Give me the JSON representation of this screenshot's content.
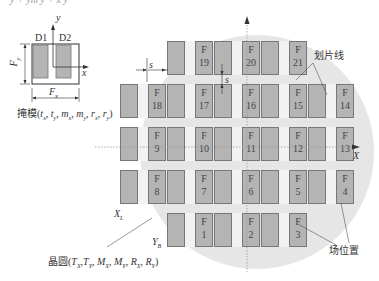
{
  "top_formula_fragment": "y + ym y + x y",
  "mask": {
    "die_labels": [
      "D1",
      "D2"
    ],
    "axis_x": "x",
    "axis_y": "y",
    "dim_height": "F_y",
    "dim_width": "F_x",
    "caption": "掩模(t_x , t_y , m_x , m_y , r_x , r_y)"
  },
  "wafer": {
    "caption": "晶圆(T_X,T_Y,M_X,M_Y,R_X,R_Y)",
    "axis_x": "X",
    "label_xl": "X_L",
    "label_yb": "Y_B",
    "spacing_label_horizontal": "s",
    "spacing_label_vertical": "s"
  },
  "callouts": {
    "scribe_line": "划片线",
    "field_position": "场位置"
  },
  "fields": [
    {
      "id": "F19",
      "letter": "F",
      "num": "19",
      "row": 0,
      "col": 1
    },
    {
      "id": "F20",
      "letter": "F",
      "num": "20",
      "row": 0,
      "col": 2
    },
    {
      "id": "F21",
      "letter": "F",
      "num": "21",
      "row": 0,
      "col": 3
    },
    {
      "id": "F18",
      "letter": "F",
      "num": "18",
      "row": 1,
      "col": 0
    },
    {
      "id": "F17",
      "letter": "F",
      "num": "17",
      "row": 1,
      "col": 1
    },
    {
      "id": "F16",
      "letter": "F",
      "num": "16",
      "row": 1,
      "col": 2
    },
    {
      "id": "F15",
      "letter": "F",
      "num": "15",
      "row": 1,
      "col": 3
    },
    {
      "id": "F14",
      "letter": "F",
      "num": "14",
      "row": 1,
      "col": 4
    },
    {
      "id": "F9",
      "letter": "F",
      "num": "9",
      "row": 2,
      "col": 0
    },
    {
      "id": "F10",
      "letter": "F",
      "num": "10",
      "row": 2,
      "col": 1
    },
    {
      "id": "F11",
      "letter": "F",
      "num": "11",
      "row": 2,
      "col": 2
    },
    {
      "id": "F12",
      "letter": "F",
      "num": "12",
      "row": 2,
      "col": 3
    },
    {
      "id": "F13",
      "letter": "F",
      "num": "13",
      "row": 2,
      "col": 4
    },
    {
      "id": "F8",
      "letter": "F",
      "num": "8",
      "row": 3,
      "col": 0
    },
    {
      "id": "F7",
      "letter": "F",
      "num": "7",
      "row": 3,
      "col": 1
    },
    {
      "id": "F6",
      "letter": "F",
      "num": "6",
      "row": 3,
      "col": 2
    },
    {
      "id": "F5",
      "letter": "F",
      "num": "5",
      "row": 3,
      "col": 3
    },
    {
      "id": "F4",
      "letter": "F",
      "num": "4",
      "row": 3,
      "col": 4
    },
    {
      "id": "F1",
      "letter": "F",
      "num": "1",
      "row": 4,
      "col": 1
    },
    {
      "id": "F2",
      "letter": "F",
      "num": "2",
      "row": 4,
      "col": 2
    },
    {
      "id": "F3",
      "letter": "F",
      "num": "3",
      "row": 4,
      "col": 3
    }
  ],
  "colors": {
    "die_fill": "#b4b4b4",
    "die_border": "#777777",
    "wafer_fill": "#e6e6e6",
    "street_fill": "#f2f2f2"
  }
}
